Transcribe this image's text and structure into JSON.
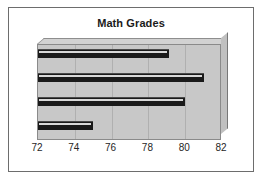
{
  "chart_data": {
    "type": "bar",
    "orientation": "horizontal",
    "title": "Math Grades",
    "xlabel": "",
    "ylabel": "",
    "categories": [
      "1",
      "2",
      "3",
      "4"
    ],
    "values": [
      79.1,
      81.0,
      80.0,
      75.0
    ],
    "xlim": [
      72,
      82
    ],
    "xticks": [
      72,
      74,
      76,
      78,
      80,
      82
    ],
    "xtick_labels": [
      "72",
      "74",
      "76",
      "78",
      "80",
      "82"
    ],
    "grid": true,
    "legend": false,
    "series": [
      {
        "name": "Math Grades",
        "values": [
          79.1,
          81.0,
          80.0,
          75.0
        ]
      }
    ],
    "style": {
      "bar_color": "#1a1a1a",
      "plot_background": "#c8c8c8",
      "frame_color": "#6d6d6d",
      "gridline_color": "#b0b0b0",
      "title_color": "#1b1b1b",
      "tick_label_color": "#262626"
    }
  }
}
